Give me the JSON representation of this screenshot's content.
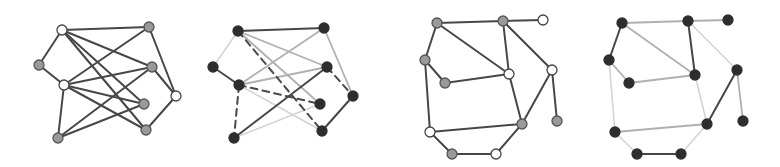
{
  "styles": {
    "edge": {
      "dark": {
        "color": "#474747",
        "width": 2.0,
        "dash": ""
      },
      "medium": {
        "color": "#b0b0b0",
        "width": 1.8,
        "dash": ""
      },
      "light": {
        "color": "#d4d4d4",
        "width": 1.6,
        "dash": ""
      },
      "dashed": {
        "color": "#4a4a4a",
        "width": 2.0,
        "dash": "7,5"
      }
    },
    "node": {
      "white": {
        "fill": "#ffffff",
        "stroke": "#444444"
      },
      "gray": {
        "fill": "#9a9a9a",
        "stroke": "#555555"
      },
      "dark": {
        "fill": "#2e2e2e",
        "stroke": "#2e2e2e"
      }
    },
    "node_radius": 5
  },
  "graphs": [
    {
      "name": "graph-1-original",
      "nodes": [
        {
          "id": "A",
          "x": 62,
          "y": 30,
          "type": "white"
        },
        {
          "id": "B",
          "x": 149,
          "y": 27,
          "type": "gray"
        },
        {
          "id": "C",
          "x": 39,
          "y": 65,
          "type": "gray"
        },
        {
          "id": "D",
          "x": 152,
          "y": 67,
          "type": "gray"
        },
        {
          "id": "E",
          "x": 64,
          "y": 85,
          "type": "white"
        },
        {
          "id": "F",
          "x": 176,
          "y": 96,
          "type": "white"
        },
        {
          "id": "G",
          "x": 144,
          "y": 104,
          "type": "gray"
        },
        {
          "id": "H",
          "x": 58,
          "y": 138,
          "type": "gray"
        },
        {
          "id": "I",
          "x": 146,
          "y": 130,
          "type": "gray"
        }
      ],
      "edges": [
        {
          "from": "A",
          "to": "B",
          "style": "dark"
        },
        {
          "from": "A",
          "to": "C",
          "style": "dark"
        },
        {
          "from": "A",
          "to": "D",
          "style": "dark"
        },
        {
          "from": "A",
          "to": "G",
          "style": "dark"
        },
        {
          "from": "A",
          "to": "I",
          "style": "dark"
        },
        {
          "from": "C",
          "to": "E",
          "style": "dark"
        },
        {
          "from": "E",
          "to": "B",
          "style": "dark"
        },
        {
          "from": "E",
          "to": "D",
          "style": "dark"
        },
        {
          "from": "E",
          "to": "G",
          "style": "dark"
        },
        {
          "from": "E",
          "to": "I",
          "style": "dark"
        },
        {
          "from": "E",
          "to": "H",
          "style": "dark"
        },
        {
          "from": "H",
          "to": "D",
          "style": "dark"
        },
        {
          "from": "H",
          "to": "G",
          "style": "dark"
        },
        {
          "from": "B",
          "to": "F",
          "style": "dark"
        },
        {
          "from": "D",
          "to": "F",
          "style": "dark"
        },
        {
          "from": "F",
          "to": "I",
          "style": "dark"
        }
      ]
    },
    {
      "name": "graph-2-styled",
      "nodes": [
        {
          "id": "A",
          "x": 238,
          "y": 31,
          "type": "dark"
        },
        {
          "id": "B",
          "x": 324,
          "y": 28,
          "type": "dark"
        },
        {
          "id": "C",
          "x": 213,
          "y": 67,
          "type": "dark"
        },
        {
          "id": "D",
          "x": 327,
          "y": 67,
          "type": "dark"
        },
        {
          "id": "E",
          "x": 239,
          "y": 85,
          "type": "dark"
        },
        {
          "id": "F",
          "x": 353,
          "y": 96,
          "type": "dark"
        },
        {
          "id": "G",
          "x": 320,
          "y": 104,
          "type": "dark"
        },
        {
          "id": "H",
          "x": 234,
          "y": 138,
          "type": "dark"
        },
        {
          "id": "I",
          "x": 322,
          "y": 131,
          "type": "dark"
        }
      ],
      "edges": [
        {
          "from": "A",
          "to": "B",
          "style": "dark"
        },
        {
          "from": "A",
          "to": "C",
          "style": "light"
        },
        {
          "from": "A",
          "to": "D",
          "style": "medium"
        },
        {
          "from": "A",
          "to": "G",
          "style": "medium"
        },
        {
          "from": "A",
          "to": "I",
          "style": "dashed"
        },
        {
          "from": "C",
          "to": "E",
          "style": "dark"
        },
        {
          "from": "E",
          "to": "B",
          "style": "medium"
        },
        {
          "from": "E",
          "to": "D",
          "style": "medium"
        },
        {
          "from": "E",
          "to": "G",
          "style": "dashed"
        },
        {
          "from": "E",
          "to": "I",
          "style": "light"
        },
        {
          "from": "E",
          "to": "H",
          "style": "dashed"
        },
        {
          "from": "H",
          "to": "D",
          "style": "dark"
        },
        {
          "from": "H",
          "to": "G",
          "style": "light"
        },
        {
          "from": "B",
          "to": "F",
          "style": "medium"
        },
        {
          "from": "D",
          "to": "F",
          "style": "dashed"
        },
        {
          "from": "F",
          "to": "I",
          "style": "dark"
        }
      ]
    },
    {
      "name": "graph-3-original",
      "nodes": [
        {
          "id": "P1",
          "x": 437,
          "y": 23,
          "type": "gray"
        },
        {
          "id": "P2",
          "x": 503,
          "y": 21,
          "type": "gray"
        },
        {
          "id": "P3",
          "x": 543,
          "y": 20,
          "type": "white"
        },
        {
          "id": "P4",
          "x": 425,
          "y": 60,
          "type": "gray"
        },
        {
          "id": "P5",
          "x": 445,
          "y": 83,
          "type": "gray"
        },
        {
          "id": "P6",
          "x": 509,
          "y": 74,
          "type": "white"
        },
        {
          "id": "P7",
          "x": 552,
          "y": 70,
          "type": "white"
        },
        {
          "id": "P8",
          "x": 522,
          "y": 124,
          "type": "gray"
        },
        {
          "id": "P9",
          "x": 557,
          "y": 121,
          "type": "gray"
        },
        {
          "id": "P10",
          "x": 430,
          "y": 132,
          "type": "white"
        },
        {
          "id": "P11",
          "x": 452,
          "y": 154,
          "type": "gray"
        },
        {
          "id": "P12",
          "x": 496,
          "y": 154,
          "type": "white"
        }
      ],
      "edges": [
        {
          "from": "P1",
          "to": "P2",
          "style": "dark"
        },
        {
          "from": "P2",
          "to": "P3",
          "style": "dark"
        },
        {
          "from": "P1",
          "to": "P4",
          "style": "dark"
        },
        {
          "from": "P1",
          "to": "P6",
          "style": "dark"
        },
        {
          "from": "P4",
          "to": "P5",
          "style": "dark"
        },
        {
          "from": "P5",
          "to": "P6",
          "style": "dark"
        },
        {
          "from": "P2",
          "to": "P6",
          "style": "dark"
        },
        {
          "from": "P2",
          "to": "P7",
          "style": "dark"
        },
        {
          "from": "P7",
          "to": "P9",
          "style": "dark"
        },
        {
          "from": "P7",
          "to": "P8",
          "style": "dark"
        },
        {
          "from": "P6",
          "to": "P8",
          "style": "dark"
        },
        {
          "from": "P4",
          "to": "P10",
          "style": "dark"
        },
        {
          "from": "P10",
          "to": "P8",
          "style": "dark"
        },
        {
          "from": "P10",
          "to": "P11",
          "style": "dark"
        },
        {
          "from": "P11",
          "to": "P12",
          "style": "dark"
        },
        {
          "from": "P12",
          "to": "P8",
          "style": "dark"
        }
      ]
    },
    {
      "name": "graph-4-styled",
      "nodes": [
        {
          "id": "Q1",
          "x": 622,
          "y": 23,
          "type": "dark"
        },
        {
          "id": "Q2",
          "x": 688,
          "y": 21,
          "type": "dark"
        },
        {
          "id": "Q3",
          "x": 728,
          "y": 20,
          "type": "dark"
        },
        {
          "id": "Q4",
          "x": 609,
          "y": 60,
          "type": "dark"
        },
        {
          "id": "Q5",
          "x": 629,
          "y": 83,
          "type": "dark"
        },
        {
          "id": "Q6",
          "x": 695,
          "y": 75,
          "type": "dark"
        },
        {
          "id": "Q7",
          "x": 737,
          "y": 70,
          "type": "dark"
        },
        {
          "id": "Q8",
          "x": 707,
          "y": 124,
          "type": "dark"
        },
        {
          "id": "Q9",
          "x": 743,
          "y": 121,
          "type": "dark"
        },
        {
          "id": "Q10",
          "x": 615,
          "y": 132,
          "type": "dark"
        },
        {
          "id": "Q11",
          "x": 637,
          "y": 154,
          "type": "dark"
        },
        {
          "id": "Q12",
          "x": 681,
          "y": 154,
          "type": "dark"
        }
      ],
      "edges": [
        {
          "from": "Q1",
          "to": "Q2",
          "style": "medium"
        },
        {
          "from": "Q2",
          "to": "Q3",
          "style": "medium"
        },
        {
          "from": "Q1",
          "to": "Q4",
          "style": "dark"
        },
        {
          "from": "Q1",
          "to": "Q6",
          "style": "medium"
        },
        {
          "from": "Q4",
          "to": "Q5",
          "style": "medium"
        },
        {
          "from": "Q5",
          "to": "Q6",
          "style": "medium"
        },
        {
          "from": "Q2",
          "to": "Q6",
          "style": "dark"
        },
        {
          "from": "Q2",
          "to": "Q7",
          "style": "light"
        },
        {
          "from": "Q7",
          "to": "Q9",
          "style": "medium"
        },
        {
          "from": "Q7",
          "to": "Q8",
          "style": "dark"
        },
        {
          "from": "Q6",
          "to": "Q8",
          "style": "light"
        },
        {
          "from": "Q4",
          "to": "Q10",
          "style": "light"
        },
        {
          "from": "Q10",
          "to": "Q8",
          "style": "medium"
        },
        {
          "from": "Q10",
          "to": "Q11",
          "style": "light"
        },
        {
          "from": "Q11",
          "to": "Q12",
          "style": "dark"
        },
        {
          "from": "Q12",
          "to": "Q8",
          "style": "light"
        }
      ]
    }
  ]
}
